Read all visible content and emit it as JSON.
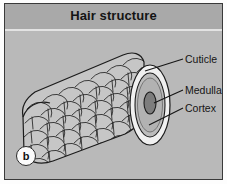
{
  "figure": {
    "title": "Hair structure",
    "panel_label": "b",
    "background_color": "#b9b9b9",
    "header_color": "#a9a9a9",
    "frame_color": "#3a3a3a",
    "text_color": "#151515"
  },
  "labels": [
    {
      "id": "cuticle",
      "text": "Cuticle"
    },
    {
      "id": "medulla",
      "text": "Medulla"
    },
    {
      "id": "cortex",
      "text": "Cortex"
    }
  ],
  "diagram": {
    "shaft_fill": "#c2c2c2",
    "end_rim_fill": "#f2f2f2",
    "cortex_fill": "#bdbdbd",
    "medulla_fill": "#7e7e7e",
    "outline_color": "#1c1c1c"
  }
}
